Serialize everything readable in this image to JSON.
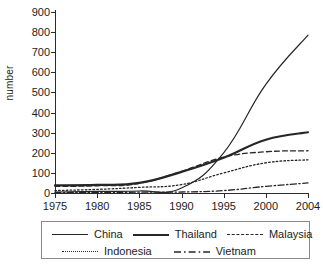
{
  "chart_data": {
    "type": "line",
    "title": "",
    "xlabel": "",
    "ylabel": "number",
    "ylim": [
      0,
      900
    ],
    "xlim": [
      1975,
      2004
    ],
    "grid": false,
    "legend_position": "bottom",
    "yticks": [
      900,
      800,
      700,
      600,
      500,
      400,
      300,
      200,
      100,
      0
    ],
    "xticks": [
      1975,
      1980,
      1985,
      1990,
      1995,
      2000,
      2004
    ],
    "x": [
      1975,
      1980,
      1985,
      1990,
      1995,
      2000,
      2004
    ],
    "series": [
      {
        "name": "China",
        "style": "solid-thin",
        "values": [
          5,
          8,
          10,
          25,
          200,
          540,
          785
        ]
      },
      {
        "name": "Thailand",
        "style": "solid-thick",
        "values": [
          38,
          40,
          50,
          105,
          175,
          265,
          302
        ]
      },
      {
        "name": "Malaysia",
        "style": "dashed",
        "values": [
          33,
          36,
          48,
          108,
          178,
          205,
          210
        ]
      },
      {
        "name": "Indonesia",
        "style": "dotted",
        "values": [
          12,
          18,
          28,
          42,
          100,
          150,
          165
        ]
      },
      {
        "name": "Vietnam",
        "style": "dash-dot",
        "values": [
          2,
          3,
          4,
          5,
          12,
          33,
          50
        ]
      }
    ]
  },
  "legend": {
    "rows": [
      [
        {
          "label": "China",
          "style": "solid-thin"
        },
        {
          "label": "Thailand",
          "style": "solid-thick"
        },
        {
          "label": "Malaysia",
          "style": "dashed"
        }
      ],
      [
        {
          "label": "Indonesia",
          "style": "dotted"
        },
        {
          "label": "Vietnam",
          "style": "dash-dot"
        }
      ]
    ]
  },
  "colors": {
    "line": "#262626",
    "axis": "#2b2b2b",
    "text": "#1c1c1c",
    "legend_border": "#8a8a8a",
    "background": "#ffffff"
  }
}
